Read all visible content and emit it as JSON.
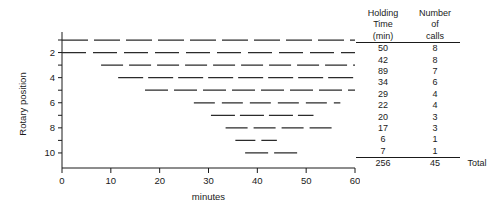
{
  "chart_data": {
    "type": "timeline",
    "title": "",
    "xlabel": "minutes",
    "ylabel": "Rotary position",
    "xlim": [
      0,
      60
    ],
    "xticks": [
      0,
      10,
      20,
      30,
      40,
      50,
      60
    ],
    "xticklabels": [
      "0",
      "10",
      "20",
      "30",
      "40",
      "50",
      "60"
    ],
    "ylim": [
      0.3,
      11
    ],
    "yticks": [
      2,
      4,
      6,
      8,
      10
    ],
    "yticklabels": [
      "2",
      "4",
      "6",
      "8",
      "10"
    ],
    "grid": false,
    "legend": false,
    "linestyle": "dashed",
    "rows": [
      {
        "position": 1,
        "start": 0.0,
        "end": 60.0,
        "holding_time": 50
      },
      {
        "position": 2,
        "start": 0.0,
        "end": 60.0,
        "holding_time": 42
      },
      {
        "position": 3,
        "start": 8.0,
        "end": 60.0,
        "holding_time": 89
      },
      {
        "position": 4,
        "start": 11.5,
        "end": 60.0,
        "holding_time": 34
      },
      {
        "position": 5,
        "start": 17.0,
        "end": 60.0,
        "holding_time": 29
      },
      {
        "position": 6,
        "start": 27.0,
        "end": 57.0,
        "holding_time": 22
      },
      {
        "position": 7,
        "start": 30.5,
        "end": 51.5,
        "holding_time": 20
      },
      {
        "position": 8,
        "start": 33.5,
        "end": 56.0,
        "holding_time": 17
      },
      {
        "position": 9,
        "start": 35.5,
        "end": 44.0,
        "holding_time": 6
      },
      {
        "position": 10,
        "start": 37.5,
        "end": 49.0,
        "holding_time": 7
      }
    ]
  },
  "table": {
    "col1_header_lines": [
      "Holding",
      "Time",
      "(min)"
    ],
    "col2_header_lines": [
      "Number",
      "of",
      "calls"
    ],
    "rows": [
      {
        "holding_time": "50",
        "calls": "8"
      },
      {
        "holding_time": "42",
        "calls": "8"
      },
      {
        "holding_time": "89",
        "calls": "7"
      },
      {
        "holding_time": "34",
        "calls": "6"
      },
      {
        "holding_time": "29",
        "calls": "4"
      },
      {
        "holding_time": "22",
        "calls": "4"
      },
      {
        "holding_time": "20",
        "calls": "3"
      },
      {
        "holding_time": "17",
        "calls": "3"
      },
      {
        "holding_time": "6",
        "calls": "1"
      },
      {
        "holding_time": "7",
        "calls": "1"
      }
    ],
    "total_holding_time": "256",
    "total_calls": "45",
    "total_label": "Total"
  }
}
